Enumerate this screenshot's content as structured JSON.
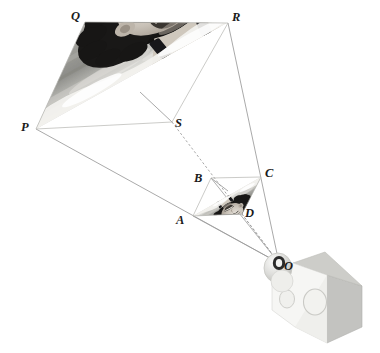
{
  "diagram": {
    "background_color": "#ffffff",
    "line_color": "#9a9a9a",
    "label_color": "#1a1a1a",
    "object_plane": {
      "name": "PQRS",
      "vertices": [
        {
          "label": "P",
          "x": 36,
          "y": 129,
          "text_x": 21,
          "text_y": 131
        },
        {
          "label": "Q",
          "x": 85,
          "y": 22,
          "text_x": 71,
          "text_y": 20
        },
        {
          "label": "R",
          "x": 228,
          "y": 23,
          "text_x": 232,
          "text_y": 21
        },
        {
          "label": "S",
          "x": 172,
          "y": 122,
          "text_x": 175,
          "text_y": 127
        }
      ],
      "photo_caption": "grayscale photograph of a laughing girl"
    },
    "image_plane": {
      "name": "ABCD",
      "vertices": [
        {
          "label": "A",
          "x": 193,
          "y": 216,
          "text_x": 178,
          "text_y": 222
        },
        {
          "label": "B",
          "x": 211,
          "y": 178,
          "text_x": 195,
          "text_y": 180
        },
        {
          "label": "C",
          "x": 261,
          "y": 177,
          "text_x": 265,
          "text_y": 176
        },
        {
          "label": "D",
          "x": 242,
          "y": 214,
          "text_x": 245,
          "text_y": 216
        }
      ],
      "photo_caption": "small inverted grayscale photograph of the girl"
    },
    "pinhole": {
      "label": "O",
      "x": 279,
      "y": 263,
      "text_x": 283,
      "text_y": 269
    },
    "rays": [
      {
        "from": "P",
        "to": "O",
        "style": "solid"
      },
      {
        "from": "Q",
        "to": "O",
        "style": "solid"
      },
      {
        "from": "R",
        "to": "O",
        "style": "solid"
      },
      {
        "from": "S",
        "to": "O",
        "style": "dashed"
      }
    ],
    "camera": {
      "name": "pinhole camera box",
      "body_color": "#f5f5f3",
      "top_face_color": "#cfcfcc",
      "side_face_color": "#c3c3c0",
      "lens_color": "#dedede",
      "aperture_color": "#2b2b2b",
      "front_circles": 2
    }
  }
}
